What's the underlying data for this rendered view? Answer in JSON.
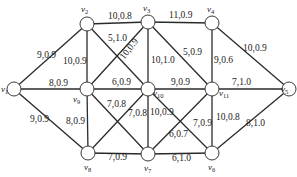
{
  "diagram": {
    "type": "network-graph",
    "nodes": [
      {
        "id": "v1",
        "name": "v",
        "sub": "1",
        "x": 14,
        "y": 89,
        "lx": 1,
        "ly": 92
      },
      {
        "id": "v2",
        "name": "v",
        "sub": "2",
        "x": 87,
        "y": 24,
        "lx": 81,
        "ly": 12
      },
      {
        "id": "v3",
        "name": "v",
        "sub": "3",
        "x": 148,
        "y": 22,
        "lx": 143,
        "ly": 11
      },
      {
        "id": "v4",
        "name": "v",
        "sub": "4",
        "x": 212,
        "y": 23,
        "lx": 207,
        "ly": 12
      },
      {
        "id": "v5",
        "name": "v",
        "sub": "5",
        "x": 289,
        "y": 89,
        "lx": 281,
        "ly": 92
      },
      {
        "id": "v9",
        "name": "v",
        "sub": "9",
        "x": 87,
        "y": 89,
        "lx": 73,
        "ly": 102
      },
      {
        "id": "v10",
        "name": "v",
        "sub": "10",
        "x": 148,
        "y": 89,
        "lx": 153,
        "ly": 96
      },
      {
        "id": "v11",
        "name": "v",
        "sub": "11",
        "x": 212,
        "y": 89,
        "lx": 219,
        "ly": 96
      },
      {
        "id": "v8",
        "name": "v",
        "sub": "8",
        "x": 88,
        "y": 153,
        "lx": 84,
        "ly": 170
      },
      {
        "id": "v7",
        "name": "v",
        "sub": "7",
        "x": 148,
        "y": 154,
        "lx": 144,
        "ly": 171
      },
      {
        "id": "v6",
        "name": "v",
        "sub": "6",
        "x": 212,
        "y": 153,
        "lx": 208,
        "ly": 170
      }
    ],
    "edges": [
      {
        "from": "v1",
        "to": "v2",
        "label": "9,0.9",
        "lx": 37,
        "ly": 58
      },
      {
        "from": "v1",
        "to": "v9",
        "label": "8,0.9",
        "lx": 49,
        "ly": 86
      },
      {
        "from": "v1",
        "to": "v8",
        "label": "9,0.9",
        "lx": 30,
        "ly": 122
      },
      {
        "from": "v2",
        "to": "v3",
        "label": "10,0.8",
        "lx": 108,
        "ly": 19
      },
      {
        "from": "v2",
        "to": "v9",
        "label": "10,0.9",
        "lx": 63,
        "ly": 64
      },
      {
        "from": "v2",
        "to": "v10",
        "label": "5,1.0",
        "lx": 108,
        "ly": 41
      },
      {
        "from": "v9",
        "to": "v3",
        "label": "10,0.9",
        "lx": 124,
        "ly": 60,
        "rotate": -52
      },
      {
        "from": "v3",
        "to": "v4",
        "label": "11,0.9",
        "lx": 169,
        "ly": 18
      },
      {
        "from": "v3",
        "to": "v10",
        "label": "10,1.0",
        "lx": 151,
        "ly": 63
      },
      {
        "from": "v3",
        "to": "v11",
        "label": "5,0.9",
        "lx": 183,
        "ly": 55
      },
      {
        "from": "v4",
        "to": "v11",
        "label": "9,0.6",
        "lx": 214,
        "ly": 63
      },
      {
        "from": "v4",
        "to": "v5",
        "label": "10,0.9",
        "lx": 243,
        "ly": 51
      },
      {
        "from": "v9",
        "to": "v10",
        "label": "6,0.9",
        "lx": 112,
        "ly": 85
      },
      {
        "from": "v10",
        "to": "v11",
        "label": "9,0.9",
        "lx": 171,
        "ly": 85
      },
      {
        "from": "v11",
        "to": "v5",
        "label": "7,1.0",
        "lx": 232,
        "ly": 85
      },
      {
        "from": "v9",
        "to": "v8",
        "label": "8,0.9",
        "lx": 66,
        "ly": 124
      },
      {
        "from": "v9",
        "to": "v7",
        "label": "7,0.8",
        "lx": 107,
        "ly": 107
      },
      {
        "from": "v8",
        "to": "v10",
        "label": "7,0.8",
        "lx": 128,
        "ly": 116
      },
      {
        "from": "v10",
        "to": "v7",
        "label": "10,0.9",
        "lx": 150,
        "ly": 115
      },
      {
        "from": "v10",
        "to": "v6",
        "label": "7,0.9",
        "lx": 193,
        "ly": 126
      },
      {
        "from": "v11",
        "to": "v7",
        "label": "6,0.7",
        "lx": 169,
        "ly": 137
      },
      {
        "from": "v11",
        "to": "v6",
        "label": "10,0.8",
        "lx": 216,
        "ly": 120
      },
      {
        "from": "v5",
        "to": "v6",
        "label": "8,1.0",
        "lx": 246,
        "ly": 126
      },
      {
        "from": "v8",
        "to": "v7",
        "label": "7,0.9",
        "lx": 108,
        "ly": 160
      },
      {
        "from": "v7",
        "to": "v6",
        "label": "6,1.0",
        "lx": 172,
        "ly": 161
      }
    ],
    "node_radius": 7
  }
}
